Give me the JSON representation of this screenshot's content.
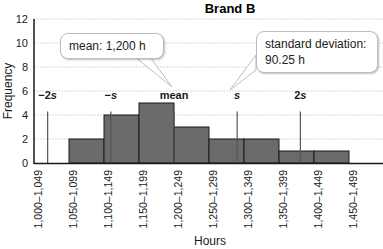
{
  "chart_data": {
    "type": "bar",
    "title": "Brand B",
    "xlabel": "Hours",
    "ylabel": "Frequency",
    "ylim": [
      0,
      12
    ],
    "yticks": [
      0,
      2,
      4,
      6,
      8,
      10,
      12
    ],
    "grid": true,
    "categories": [
      "1,000–1,049",
      "1,050–1,099",
      "1,100–1,149",
      "1,150–1,199",
      "1,200–1,249",
      "1,250–1,299",
      "1,300–1,349",
      "1,350–1,399",
      "1,400–1,449",
      "1,450–1,499"
    ],
    "values": [
      0,
      2,
      4,
      5,
      3,
      2,
      2,
      1,
      1,
      0
    ],
    "markers": [
      {
        "label": "−2s",
        "position": 1019.5
      },
      {
        "label": "−s",
        "position": 1109.75
      },
      {
        "label": "mean",
        "position": 1200
      },
      {
        "label": "s",
        "position": 1290.25
      },
      {
        "label": "2s",
        "position": 1380.5
      }
    ],
    "annotations": [
      {
        "text": "mean: 1,200 h"
      },
      {
        "text": "standard deviation: 90.25 h"
      }
    ],
    "colors": {
      "bar": "#6b6b6b",
      "bar_edge": "#1a1a1a",
      "grid": "#d9d9d9",
      "marker_line": "#555555"
    }
  },
  "callouts": {
    "mean": "mean: 1,200 h",
    "sd_line1": "standard deviation:",
    "sd_line2": "90.25 h"
  }
}
